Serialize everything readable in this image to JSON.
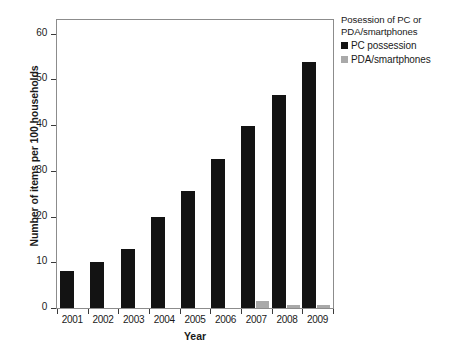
{
  "chart_data": {
    "type": "bar",
    "title": "",
    "xlabel": "Year",
    "ylabel": "Number of items per 100 households",
    "categories": [
      "2001",
      "2002",
      "2003",
      "2004",
      "2005",
      "2006",
      "2007",
      "2008",
      "2009"
    ],
    "ylim": [
      0,
      63
    ],
    "yticks": [
      0,
      10,
      20,
      30,
      40,
      50,
      60
    ],
    "ytick_labels": [
      "0",
      "10",
      "20",
      "30",
      "40",
      "50",
      "60"
    ],
    "grid": false,
    "legend_position": "right",
    "legend_title": "Posession of PC or PDA/smartphones",
    "series": [
      {
        "name": "PC possession",
        "color": "#131313",
        "values": [
          8.1,
          10.0,
          13.0,
          19.9,
          25.7,
          32.7,
          39.8,
          46.7,
          53.8
        ]
      },
      {
        "name": "PDA/smartphones",
        "color": "#a9a9a9",
        "values": [
          0,
          0,
          0,
          0,
          0,
          0,
          1.6,
          0.7,
          0.7
        ]
      }
    ]
  },
  "legend": {
    "title": "Posession of PC or PDA/smartphones",
    "items": [
      {
        "label": "PC possession",
        "color": "#131313"
      },
      {
        "label": "PDA/smartphones",
        "color": "#a9a9a9"
      }
    ]
  },
  "axes": {
    "y_title": "Number of items per 100 households",
    "x_title": "Year"
  },
  "caption": ""
}
